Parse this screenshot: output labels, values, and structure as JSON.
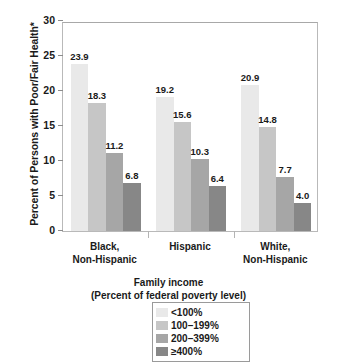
{
  "chart_data": {
    "type": "bar",
    "title": "",
    "xlabel": "Family income (Percent of federal poverty level)",
    "ylabel": "Percent of Persons with Poor/Fair Health*",
    "ylim": [
      0,
      30
    ],
    "yticks": [
      0,
      5,
      10,
      15,
      20,
      25,
      30
    ],
    "grid": false,
    "legend_position": "bottom",
    "categories": [
      "Black,\nNon-Hispanic",
      "Hispanic",
      "White,\nNon-Hispanic"
    ],
    "series": [
      {
        "name": "<100%",
        "color": "#e9e9e9",
        "values": [
          23.9,
          19.2,
          20.9
        ]
      },
      {
        "name": "100–199%",
        "color": "#c6c6c6",
        "values": [
          18.3,
          15.6,
          14.8
        ]
      },
      {
        "name": "200–399%",
        "color": "#a6a6a6",
        "values": [
          11.2,
          10.3,
          7.7
        ]
      },
      {
        "name": "≥400%",
        "color": "#878787",
        "values": [
          6.8,
          6.4,
          4.0
        ]
      }
    ]
  },
  "axes": {
    "y_title": "Percent of Persons with Poor/Fair Health*",
    "x_title_line1": "Family income",
    "x_title_line2": "(Percent of federal poverty level)",
    "y_tick_labels": [
      "0",
      "5",
      "10",
      "15",
      "20",
      "25",
      "30"
    ]
  },
  "categories": [
    {
      "label": "Black,\nNon-Hispanic"
    },
    {
      "label": "Hispanic"
    },
    {
      "label": "White,\nNon-Hispanic"
    }
  ],
  "bar_values": {
    "g0": [
      "23.9",
      "18.3",
      "11.2",
      "6.8"
    ],
    "g1": [
      "19.2",
      "15.6",
      "10.3",
      "6.4"
    ],
    "g2": [
      "20.9",
      "14.8",
      "7.7",
      "4.0"
    ]
  },
  "legend": {
    "items": [
      {
        "label": "<100%",
        "color": "#e9e9e9"
      },
      {
        "label": "100–199%",
        "color": "#c6c6c6"
      },
      {
        "label": "200–399%",
        "color": "#a6a6a6"
      },
      {
        "label": "≥400%",
        "color": "#878787"
      }
    ]
  }
}
